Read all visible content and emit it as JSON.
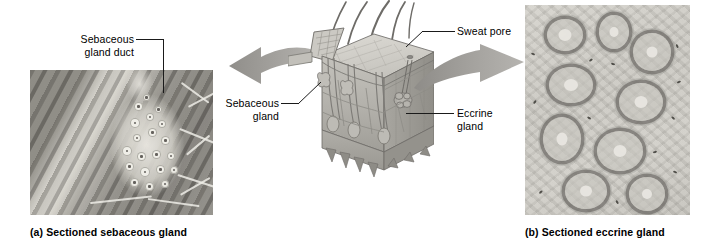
{
  "figure": {
    "kind": "anatomy-figure",
    "background_color": "#ffffff",
    "width": 710,
    "height": 247
  },
  "labels": {
    "sebaceous_gland_duct": "Sebaceous\ngland duct",
    "sebaceous_gland": "Sebaceous\ngland",
    "sweat_pore": "Sweat pore",
    "eccrine_gland": "Eccrine\ngland"
  },
  "captions": {
    "panel_a": "(a)  Sectioned sebaceous gland",
    "panel_b": "(b)  Sectioned eccrine gland"
  },
  "panels": {
    "a": {
      "name": "Sectioned sebaceous gland",
      "type": "light micrograph",
      "tint": "#9a9a96"
    },
    "b": {
      "name": "Sectioned eccrine gland",
      "type": "light micrograph",
      "tint": "#cecbc5"
    }
  },
  "diagram": {
    "name": "skin block",
    "structures": [
      "hair shaft",
      "epidermis",
      "dermis",
      "hypodermis",
      "sebaceous gland",
      "eccrine gland",
      "sweat pore",
      "hair follicle",
      "blood vessels"
    ],
    "colors": {
      "epidermis": "#cfcdc7",
      "dermis": "#b8b6b0",
      "hypodermis": "#a9a7a1",
      "outline": "#6b6965",
      "vessel": "#8d8b86"
    }
  },
  "arrows": {
    "left": {
      "direction": "left",
      "color": "#9e9c98"
    },
    "right": {
      "direction": "right",
      "color": "#9e9c98"
    }
  },
  "leader_color": "#1a1a1a"
}
